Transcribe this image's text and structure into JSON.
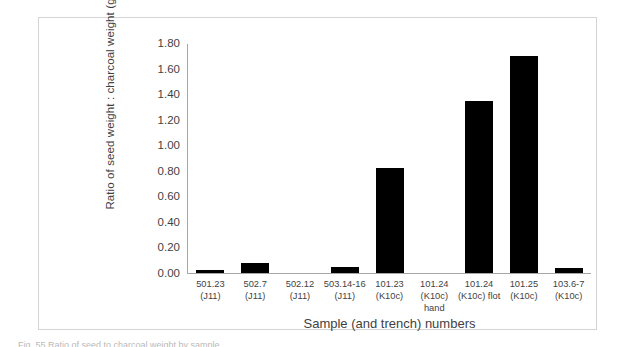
{
  "figure": {
    "caption_partial": "Fig. 55 Ratio of seed to charcoal weight by sample"
  },
  "chart_data": {
    "type": "bar",
    "title": "",
    "xlabel": "Sample (and trench) numbers",
    "ylabel": "Ratio of seed weight : charcoal weight (g)",
    "categories": [
      "501.23 (J11)",
      "502.7 (J11)",
      "502.12 (J11)",
      "503.14-16 (J11)",
      "101.23 (K10c)",
      "101.24 (K10c) hand",
      "101.24 (K10c) flot",
      "101.25 (K10c)",
      "103.6-7 (K10c)"
    ],
    "category_lines": [
      [
        "501.23",
        "(J11)"
      ],
      [
        "502.7 (J11)",
        ""
      ],
      [
        "502.12",
        "(J11)"
      ],
      [
        "503.14-16",
        "(J11)"
      ],
      [
        "101.23",
        "(K10c)"
      ],
      [
        "101.24",
        "(K10c) hand"
      ],
      [
        "101.24",
        "(K10c) flot"
      ],
      [
        "101.25",
        "(K10c)"
      ],
      [
        "103.6-7",
        "(K10c)"
      ]
    ],
    "values": [
      0.02,
      0.08,
      0.0,
      0.05,
      0.82,
      0.0,
      1.35,
      1.7,
      0.04
    ],
    "ylim": [
      0.0,
      1.8
    ],
    "ytick_labels": [
      "0.00",
      "0.20",
      "0.40",
      "0.60",
      "0.80",
      "1.00",
      "1.20",
      "1.40",
      "1.60",
      "1.80"
    ],
    "ytick_values": [
      0.0,
      0.2,
      0.4,
      0.6,
      0.8,
      1.0,
      1.2,
      1.4,
      1.6,
      1.8
    ],
    "grid": false,
    "legend": null,
    "bar_color": "#000000",
    "axis_color": "#a6a6a6"
  }
}
